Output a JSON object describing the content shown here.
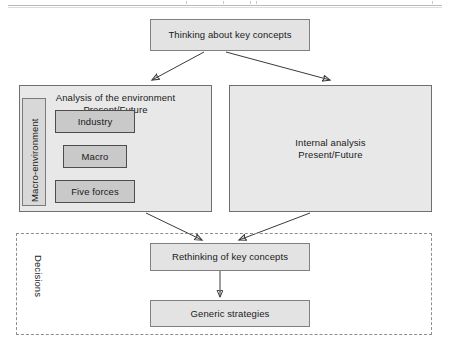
{
  "figure": {
    "title_top_box": "Thinking about key concepts",
    "left_panel": {
      "title_line1": "Analysis of the environment",
      "title_line2": "Present/Future",
      "macro_environment_label": "Macro-environment",
      "inner_boxes": [
        {
          "label": "Industry"
        },
        {
          "label": "Macro"
        },
        {
          "label": "Five forces"
        }
      ]
    },
    "right_panel": {
      "title_line1": "Internal analysis",
      "title_line2": "Present/Future"
    },
    "decisions_region": {
      "label": "Decisions",
      "boxes": [
        {
          "label": "Rethinking of key concepts"
        },
        {
          "label": "Generic strategies"
        }
      ]
    },
    "colors": {
      "box_fill": "#e3e3e3",
      "panel_fill": "#e8e8e8",
      "inner_box_fill": "#c9c9c9",
      "macro_frame_fill": "#d8d8d8",
      "box_border": "#808080",
      "inner_border": "#4d4d4d",
      "arrow": "#3a3a3a",
      "dashed_border": "#8e8e8e",
      "text": "#1a1a1a",
      "background": "#ffffff"
    }
  }
}
